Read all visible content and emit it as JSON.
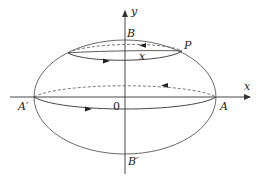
{
  "diagram": {
    "type": "ellipsoid-of-revolution-with-circulation",
    "colors": {
      "line": "#333333",
      "background": "#ffffff"
    },
    "axes": {
      "x_label": "x",
      "y_label": "y",
      "origin_label": "0"
    },
    "points": {
      "A": "A",
      "A_prime": "A′",
      "B": "B",
      "B_prime": "B′",
      "P": "P"
    },
    "curve_labels": {
      "parallel_circle_label": "x"
    },
    "elements": [
      {
        "name": "outer-ellipse",
        "style": "solid"
      },
      {
        "name": "equator-circle",
        "front": "solid",
        "back": "dashed",
        "arrow_front": "right",
        "arrow_back": "left"
      },
      {
        "name": "parallel-circle-through-P",
        "front": "solid",
        "back": "dashed",
        "arrow_front": "right",
        "arrow_back": "left"
      }
    ]
  }
}
